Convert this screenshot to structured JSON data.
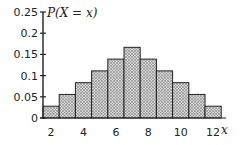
{
  "chart_data": {
    "type": "bar",
    "title": "",
    "ylabel": "P(X = x)",
    "xlabel": "x",
    "categories": [
      "2",
      "3",
      "4",
      "5",
      "6",
      "7",
      "8",
      "9",
      "10",
      "11",
      "12"
    ],
    "values": [
      0.0278,
      0.0556,
      0.0833,
      0.1111,
      0.1389,
      0.1667,
      0.1389,
      0.1111,
      0.0833,
      0.0556,
      0.0278
    ],
    "x_tick_labels": [
      "2",
      "4",
      "6",
      "8",
      "10",
      "12"
    ],
    "y_tick_labels": [
      "0",
      "0.05",
      "0.1",
      "0.15",
      "0.2",
      "0.25"
    ],
    "ylim": [
      0,
      0.25
    ],
    "grid": false,
    "legend": null,
    "bar_fill": "crosshatch gray",
    "bar_stroke": "#222222"
  }
}
